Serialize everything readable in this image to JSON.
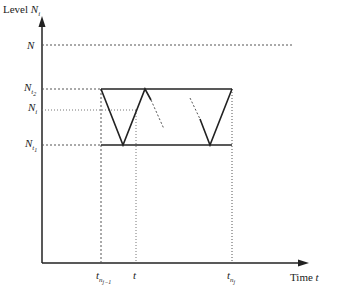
{
  "diagram": {
    "y_axis_label": {
      "text": "Level ",
      "var": "N",
      "sub": "i"
    },
    "x_axis_label": {
      "text": "Time ",
      "var": "t"
    },
    "y_levels": [
      {
        "name": "N",
        "var": "N",
        "sub": "",
        "y": 45
      },
      {
        "name": "N_t2",
        "var": "N",
        "sub": "t",
        "subsub": "2",
        "y": 89
      },
      {
        "name": "N_i",
        "var": "N",
        "sub": "i",
        "y": 110
      },
      {
        "name": "N_t1",
        "var": "N",
        "sub": "t",
        "subsub": "1",
        "y": 145
      }
    ],
    "x_ticks": [
      {
        "name": "t_nj-1",
        "var": "t",
        "sub": "n",
        "subsub": "j−1",
        "x": 101
      },
      {
        "name": "t",
        "var": "t",
        "sub": "",
        "x": 136
      },
      {
        "name": "t_nj",
        "var": "t",
        "sub": "n",
        "subsub": "j",
        "x": 232
      }
    ],
    "colors": {
      "line": "#222222",
      "dotted": "#555555"
    }
  }
}
